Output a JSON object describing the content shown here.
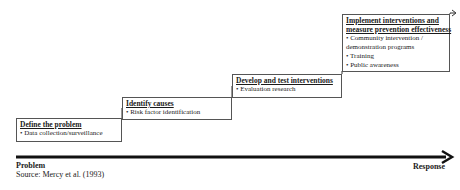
{
  "steps": [
    {
      "title": "Define the problem",
      "items": [
        "• Data collection/surveillance"
      ]
    },
    {
      "title": "Identify causes",
      "items": [
        "• Risk factor identification"
      ]
    },
    {
      "title": "Develop and test interventions",
      "items": [
        "• Evaluation research"
      ]
    },
    {
      "title_line1": "Implement interventions and",
      "title_line2": "measure prevention effectiveness",
      "items": [
        "• Community intervention /",
        "demonstration programs",
        "• Training",
        "• Public awareness"
      ]
    }
  ],
  "axis": {
    "start_label": "Problem",
    "end_label": "Response"
  },
  "source": "Source: Mercy et al. (1993)"
}
